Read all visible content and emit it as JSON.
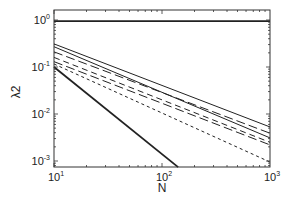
{
  "chart_data": {
    "type": "line",
    "title": "",
    "xlabel": "N",
    "ylabel": "λ2",
    "xscale": "log",
    "yscale": "log",
    "xlim": [
      10,
      1000
    ],
    "ylim": [
      0.00074,
      1.6
    ],
    "grid": false,
    "legend": null,
    "x_ticks": [
      {
        "value": 10,
        "base": "10",
        "exp": "1"
      },
      {
        "value": 100,
        "base": "10",
        "exp": "2"
      },
      {
        "value": 1000,
        "base": "10",
        "exp": "3"
      }
    ],
    "y_ticks": [
      {
        "value": 1,
        "base": "10",
        "exp": "0"
      },
      {
        "value": 0.1,
        "base": "10",
        "exp": "-1"
      },
      {
        "value": 0.01,
        "base": "10",
        "exp": "-2"
      },
      {
        "value": 0.001,
        "base": "10",
        "exp": "-3"
      }
    ],
    "series": [
      {
        "name": "flat",
        "style": "solid",
        "width": 1.8,
        "x": [
          10,
          1000
        ],
        "y": [
          0.95,
          0.95
        ]
      },
      {
        "name": "s1",
        "style": "solid",
        "width": 1.0,
        "x": [
          10,
          1000
        ],
        "y": [
          0.31,
          0.0053
        ]
      },
      {
        "name": "s2",
        "style": "longdash",
        "width": 1.0,
        "x": [
          10,
          1000
        ],
        "y": [
          0.21,
          0.0039
        ]
      },
      {
        "name": "s3",
        "style": "solid",
        "width": 1.0,
        "x": [
          10,
          1000
        ],
        "y": [
          0.27,
          0.0031
        ]
      },
      {
        "name": "s4",
        "style": "dash",
        "width": 1.0,
        "x": [
          10,
          1000
        ],
        "y": [
          0.16,
          0.0025
        ]
      },
      {
        "name": "s5",
        "style": "longdash",
        "width": 1.0,
        "x": [
          10,
          1000
        ],
        "y": [
          0.13,
          0.0022
        ]
      },
      {
        "name": "s6",
        "style": "shortdash",
        "width": 1.0,
        "x": [
          10,
          1000
        ],
        "y": [
          0.116,
          0.00095
        ]
      },
      {
        "name": "steep",
        "style": "solid",
        "width": 1.8,
        "x": [
          10,
          141
        ],
        "y": [
          0.1,
          0.00074
        ]
      }
    ]
  }
}
